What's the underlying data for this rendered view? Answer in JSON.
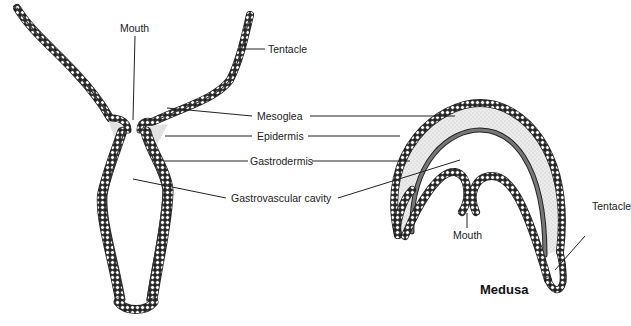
{
  "figure": {
    "polyp": {
      "labels": {
        "mouth": "Mouth",
        "tentacle": "Tentacle",
        "mesoglea": "Mesoglea",
        "epidermis": "Epidermis",
        "gastrodermis": "Gastrodermis",
        "gastrovascular_cavity": "Gastrovascular cavity"
      }
    },
    "medusa": {
      "title": "Medusa",
      "labels": {
        "mouth": "Mouth",
        "tentacle": "Tentacle"
      }
    },
    "colors": {
      "outline": "#1a1a1a",
      "mesoglea_fill": "#e6e6e6",
      "background": "#ffffff"
    }
  }
}
